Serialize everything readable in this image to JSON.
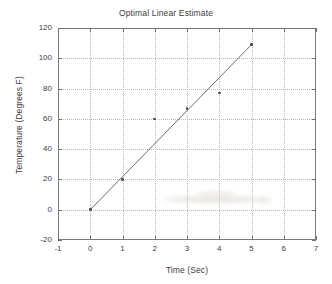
{
  "chart_data": {
    "type": "scatter",
    "title": "Optimal Linear Estimate",
    "xlabel": "Time (Sec)",
    "ylabel": "Temperature (Degrees F)",
    "xlim": [
      -1,
      7
    ],
    "ylim": [
      -20,
      120
    ],
    "xticks": [
      -1,
      0,
      1,
      2,
      3,
      4,
      5,
      6,
      7
    ],
    "yticks": [
      -20,
      0,
      20,
      40,
      60,
      80,
      100,
      120
    ],
    "xtick_labels": [
      "-1",
      "0",
      "1",
      "2",
      "3",
      "4",
      "5",
      "6",
      "7"
    ],
    "ytick_labels": [
      "-20",
      "0",
      "20",
      "40",
      "60",
      "80",
      "100",
      "120"
    ],
    "grid": true,
    "legend": null,
    "series": [
      {
        "name": "Measurements",
        "type": "scatter",
        "marker": "dot",
        "color": "#4c4c4c",
        "x": [
          0,
          1,
          2,
          3,
          4,
          5
        ],
        "values": [
          0,
          20,
          60,
          67,
          77,
          109
        ]
      },
      {
        "name": "Optimal Linear Estimate",
        "type": "line",
        "color": "#5a5a5a",
        "x": [
          0,
          5
        ],
        "values": [
          0,
          109
        ]
      }
    ],
    "colors": {
      "axis": "#7b7b7b",
      "grid": "#b9b9b9",
      "text": "#3d3d3d",
      "marker": "#4c4c4c",
      "line": "#5a5a5a",
      "background": "#ffffff"
    }
  }
}
